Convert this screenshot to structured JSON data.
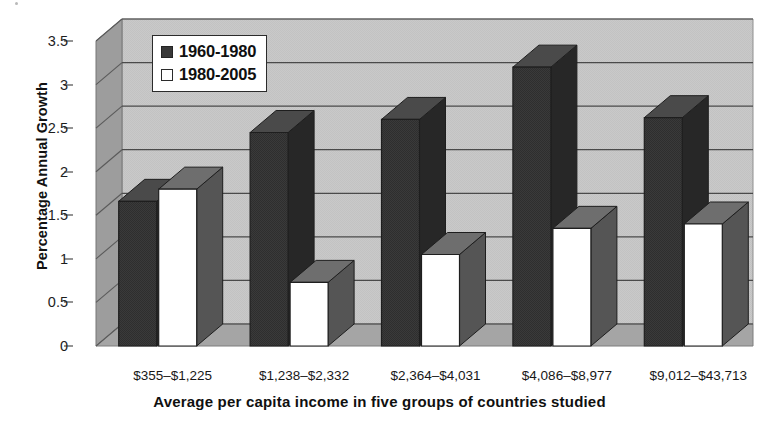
{
  "chart_data": {
    "type": "bar",
    "title": "",
    "xlabel": "Average per capita income in five groups of countries studied",
    "ylabel": "Percentage Annual Growth",
    "categories": [
      "$355–$1,225",
      "$1,238–$2,332",
      "$2,364–$4,031",
      "$4,086–$8,977",
      "$9,012–$43,713"
    ],
    "series": [
      {
        "name": "1960-1980",
        "color": "#383838",
        "values": [
          1.66,
          2.45,
          2.6,
          3.2,
          2.62
        ]
      },
      {
        "name": "1980-2005",
        "color": "#ffffff",
        "values": [
          1.8,
          0.73,
          1.05,
          1.35,
          1.4
        ]
      }
    ],
    "ylim": [
      0,
      3.5
    ],
    "ytick_values": [
      0,
      0.5,
      1,
      1.5,
      2,
      2.5,
      3,
      3.5
    ],
    "ytick_labels": [
      "0",
      "0.5",
      "1",
      "1.5",
      "2",
      "2.5",
      "3",
      "3.5"
    ],
    "grid": true,
    "legend_position": "top-left-inside",
    "style": "3d-grayscale",
    "plot_background": "#c9c9c9",
    "wall_shadow": "#9a9a9a",
    "floor_color": "#a8a8a8",
    "gridline_color": "#4a4a4a"
  },
  "legend": {
    "entries": [
      {
        "label": "1960-1980",
        "swatch": "dark"
      },
      {
        "label": "1980-2005",
        "swatch": "light"
      }
    ]
  }
}
